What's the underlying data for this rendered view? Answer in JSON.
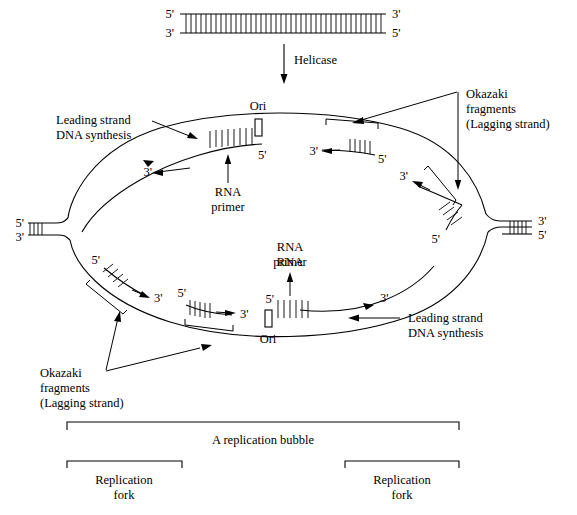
{
  "diagram": {
    "stroke_color": "#000000",
    "background_color": "#ffffff"
  },
  "top_duplex": {
    "left_top_label": "5'",
    "left_bottom_label": "3'",
    "right_top_label": "3'",
    "right_bottom_label": "5'"
  },
  "helicase": {
    "label": "Helicase"
  },
  "labels": {
    "ori": "Ori",
    "rna_primer": "RNA\nprimer",
    "rna_primer_line1": "RNA",
    "rna_primer_line2": "primer",
    "leading_strand_line1": "Leading strand",
    "leading_strand_line2": "DNA synthesis",
    "okazaki_line1": "Okazaki",
    "okazaki_line2": "fragments",
    "okazaki_line3": "(Lagging strand)",
    "replication_bubble": "A replication bubble",
    "replication_fork_line1": "Replication",
    "replication_fork_line2": "fork",
    "five_prime": "5'",
    "three_prime": "3'"
  },
  "forks": {
    "left": {
      "top_label": "5'",
      "bottom_label": "3'"
    },
    "right": {
      "top_label": "3'",
      "bottom_label": "5'"
    }
  },
  "annotations": {
    "top_leading": {
      "line1": "Leading strand",
      "line2": "DNA synthesis"
    },
    "bottom_leading": {
      "line1": "Leading strand",
      "line2": "DNA synthesis"
    },
    "top_okazaki": {
      "line1": "Okazaki",
      "line2": "fragments",
      "line3": "(Lagging strand)"
    },
    "bottom_okazaki": {
      "line1": "Okazaki",
      "line2": "fragments",
      "line3": "(Lagging strand)"
    },
    "top_ori": "Ori",
    "bottom_ori": "Ori",
    "top_rna_primer": {
      "line1": "RNA",
      "line2": "primer"
    },
    "bottom_rna_primer": {
      "line1": "RNA",
      "line2": "primer"
    }
  },
  "strand_end_labels": {
    "top_strand_left_three": "3'",
    "top_strand_ori_five": "5'",
    "top_okazaki_three": "3'",
    "top_okazaki_five": "5'",
    "top_right_okazaki_three": "3'",
    "top_right_okazaki_five": "5'",
    "bottom_left_okazaki_five": "5'",
    "bottom_left_okazaki_three": "3'",
    "bottom_mid_okazaki_five": "5'",
    "bottom_mid_okazaki_three": "3'",
    "bottom_ori_five": "5'",
    "bottom_right_three": "3'"
  },
  "brackets": {
    "bubble": "A replication bubble",
    "left_fork": {
      "line1": "Replication",
      "line2": "fork"
    },
    "right_fork": {
      "line1": "Replication",
      "line2": "fork"
    }
  }
}
